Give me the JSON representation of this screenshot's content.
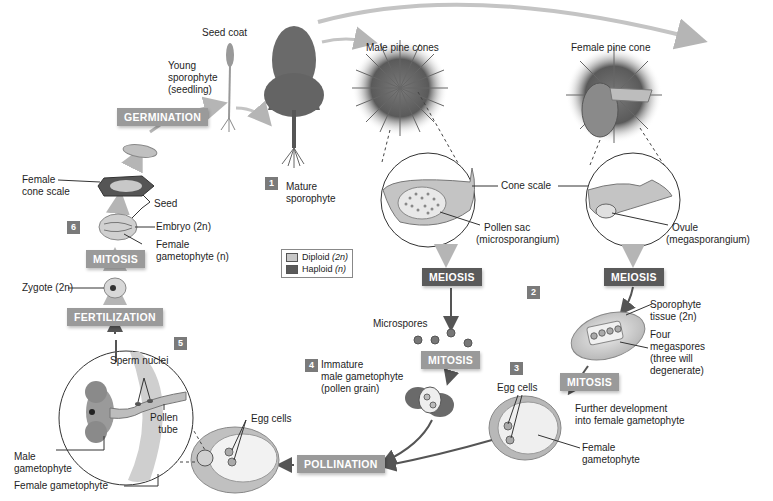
{
  "diagram": {
    "processes": {
      "germination": "GERMINATION",
      "mitosis_seed": "MITOSIS",
      "fertilization": "FERTILIZATION",
      "meiosis_male": "MEIOSIS",
      "meiosis_female": "MEIOSIS",
      "mitosis_male": "MITOSIS",
      "mitosis_female": "MITOSIS",
      "pollination": "POLLINATION"
    },
    "steps": [
      "1",
      "2",
      "3",
      "4",
      "5",
      "6"
    ],
    "labels": {
      "seed_coat": "Seed coat",
      "young_sporophyte": [
        "Young",
        "sporophyte",
        "(seedling)"
      ],
      "mature_sporophyte": [
        "Mature",
        "sporophyte"
      ],
      "male_pine_cones": "Male pine cones",
      "female_pine_cone": "Female pine cone",
      "cone_scale": "Cone scale",
      "pollen_sac": [
        "Pollen sac",
        "(microsporangium)"
      ],
      "ovule": [
        "Ovule",
        "(megasporangium)"
      ],
      "female_cone_scale": [
        "Female",
        "cone scale"
      ],
      "seed": "Seed",
      "embryo": "Embryo (2n)",
      "female_gametophyte_n": [
        "Female",
        "gametophyte (n)"
      ],
      "zygote": "Zygote (2n)",
      "microspores": "Microspores",
      "immature_male_gametophyte": [
        "Immature",
        "male gametophyte",
        "(pollen grain)"
      ],
      "sporophyte_tissue": [
        "Sporophyte",
        "tissue (2n)"
      ],
      "four_megaspores": [
        "Four",
        "megaspores",
        "(three will",
        "degenerate)"
      ],
      "egg_cells_right": "Egg cells",
      "further_development": [
        "Further development",
        "into female gametophyte"
      ],
      "female_gametophyte_right": [
        "Female",
        "gametophyte"
      ],
      "sperm_nuclei": "Sperm nuclei",
      "pollen_tube": [
        "Pollen",
        "tube"
      ],
      "male_gametophyte": [
        "Male",
        "gametophyte"
      ],
      "female_gametophyte_bottom": "Female gametophyte",
      "egg_cells_bottom": "Egg cells"
    },
    "legend": [
      {
        "label": "Diploid",
        "ploidy": "(2n)",
        "color": "#c8c8c8"
      },
      {
        "label": "Haploid",
        "ploidy": "(n)",
        "color": "#5a5a5a"
      }
    ],
    "colors": {
      "diploid_process": "#9a9a9a",
      "haploid_process": "#5a5a5a",
      "diploid_arrow": "#b0b0b0",
      "haploid_arrow": "#555555"
    }
  }
}
